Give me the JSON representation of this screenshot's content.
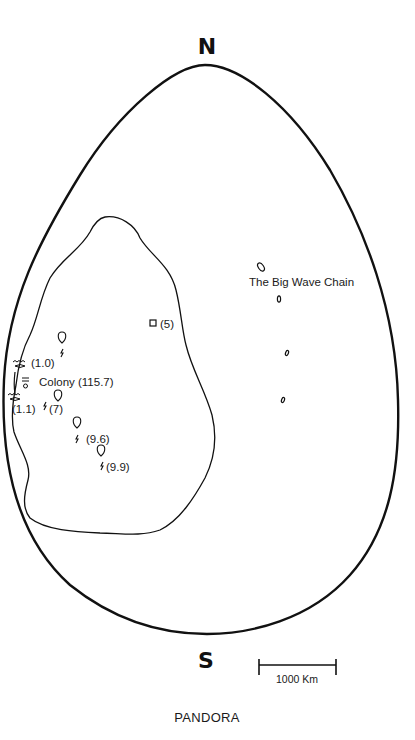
{
  "map": {
    "title": "PANDORA",
    "compass": {
      "north": "N",
      "south": "S"
    },
    "scale_bar": {
      "label": "1000 Km"
    },
    "colors": {
      "ink": "#111111",
      "paper": "#ffffff"
    },
    "features": {
      "big_wave_chain": {
        "label": "The Big Wave Chain",
        "icon": "islet-icon",
        "count": 4
      },
      "colony": {
        "label": "Colony (115.7)",
        "icon": "colony-icon"
      },
      "square_site": {
        "label": "(5)",
        "icon": "square-marker-icon"
      },
      "wave_sites": [
        {
          "label": "(1.0)",
          "icon": "wave-icon"
        },
        {
          "label": "(1.1)",
          "icon": "wave-icon"
        }
      ],
      "balloon_sites": [
        {
          "label": "",
          "icon": "balloon-icon"
        },
        {
          "label": "(7)",
          "icon": "balloon-icon"
        },
        {
          "label": "(9.6)",
          "icon": "balloon-icon"
        },
        {
          "label": "(9.9)",
          "icon": "balloon-icon"
        }
      ]
    }
  }
}
